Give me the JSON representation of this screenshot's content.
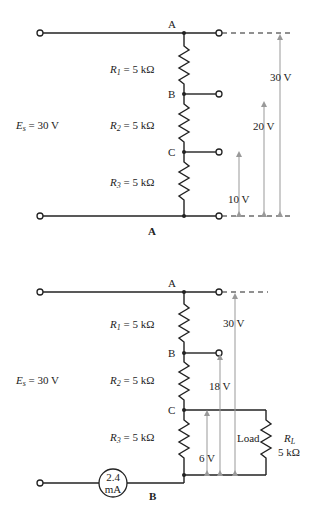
{
  "diagram_a": {
    "caption": "A",
    "source": {
      "sym": "E",
      "sub": "s",
      "value": " = 30 V"
    },
    "nodes": {
      "a": "A",
      "b": "B",
      "c": "C"
    },
    "resistors": [
      {
        "sym": "R",
        "sub": "1",
        "value": " = 5 kΩ"
      },
      {
        "sym": "R",
        "sub": "2",
        "value": " = 5 kΩ"
      },
      {
        "sym": "R",
        "sub": "3",
        "value": " = 5 kΩ"
      }
    ],
    "voltages": {
      "v30": "30 V",
      "v20": "20 V",
      "v10": "10 V"
    }
  },
  "diagram_b": {
    "caption": "B",
    "source": {
      "sym": "E",
      "sub": "s",
      "value": " = 30 V"
    },
    "nodes": {
      "a": "A",
      "b": "B",
      "c": "C"
    },
    "resistors": [
      {
        "sym": "R",
        "sub": "1",
        "value": " = 5 kΩ"
      },
      {
        "sym": "R",
        "sub": "2",
        "value": " = 5 kΩ"
      },
      {
        "sym": "R",
        "sub": "3",
        "value": " = 5 kΩ"
      }
    ],
    "voltages": {
      "v30": "30 V",
      "v18": "18 V",
      "v6": "6 V"
    },
    "load": {
      "label": "Load",
      "sym": "R",
      "sub": "L",
      "value": "5 kΩ"
    },
    "meter": {
      "line1": "2.4",
      "line2": "mA"
    }
  }
}
